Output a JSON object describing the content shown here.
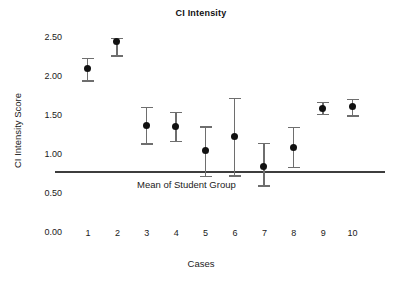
{
  "chart_data": {
    "type": "scatter",
    "title": "CI Intensity",
    "xlabel": "Cases",
    "ylabel": "CI Intensity Score",
    "categories": [
      "1",
      "2",
      "3",
      "4",
      "5",
      "6",
      "7",
      "8",
      "9",
      "10"
    ],
    "ytick_labels": [
      "2.50",
      "2.00",
      "1.50",
      "1.00",
      "0.50",
      "0.00"
    ],
    "ytick_values": [
      2.5,
      2.0,
      1.5,
      1.0,
      0.5,
      0.0
    ],
    "ylim": [
      0.0,
      2.65
    ],
    "grid": false,
    "legend": "none",
    "series": [
      {
        "name": "CI Intensity Score",
        "values": [
          2.11,
          2.45,
          1.38,
          1.37,
          1.06,
          1.24,
          0.85,
          1.09,
          1.6,
          1.62
        ],
        "error_low": [
          1.96,
          2.28,
          1.15,
          1.18,
          0.73,
          0.74,
          0.61,
          0.85,
          1.53,
          1.51
        ],
        "error_high": [
          2.25,
          2.5,
          1.62,
          1.55,
          1.37,
          1.73,
          1.16,
          1.36,
          1.68,
          1.72
        ]
      }
    ],
    "annotations": [
      {
        "name": "mean-of-student-group",
        "label": "Mean of Student Group",
        "type": "hline",
        "value": 0.79,
        "color": "#3d3d3d"
      }
    ],
    "colors": {
      "marker": "#111111",
      "errorbar": "#6e6e6e",
      "reference_line": "#3d3d3d",
      "text": "#1a1a1a",
      "background": "#ffffff"
    }
  }
}
